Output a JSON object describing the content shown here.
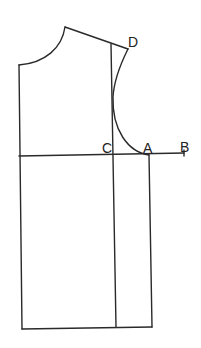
{
  "diagram": {
    "type": "bodice-pattern-draft",
    "labels": {
      "D": "D",
      "C": "C",
      "A": "A",
      "B": "B"
    },
    "colors": {
      "line": "#2a2a2a",
      "background": "#ffffff"
    }
  }
}
